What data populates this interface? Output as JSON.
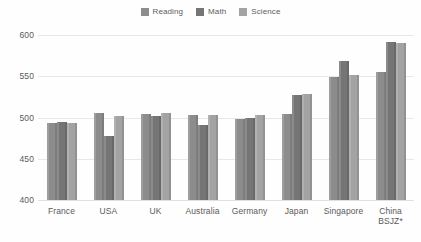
{
  "chart_data": {
    "type": "bar",
    "title": "",
    "subtitle": "",
    "xlabel": "",
    "ylabel": "",
    "ylim": [
      400,
      600
    ],
    "yticks": [
      400,
      450,
      500,
      550,
      600
    ],
    "ytick_labels": [
      "400",
      "450",
      "500",
      "550",
      "600"
    ],
    "grid": true,
    "legend_position": "top-center",
    "orientation": "vertical",
    "grouped": true,
    "categories": [
      "France",
      "USA",
      "UK",
      "Australia",
      "Germany",
      "Japan",
      "Singapore",
      "China\nBSJZ*"
    ],
    "series": [
      {
        "name": "Reading",
        "color": "#8c8c8c",
        "values": [
          493,
          505,
          504,
          503,
          498,
          504,
          549,
          555
        ]
      },
      {
        "name": "Math",
        "color": "#757575",
        "values": [
          495,
          478,
          502,
          491,
          500,
          527,
          569,
          591
        ]
      },
      {
        "name": "Science",
        "color": "#a3a3a3",
        "values": [
          493,
          502,
          505,
          503,
          503,
          529,
          551,
          590
        ]
      }
    ],
    "annotations": []
  },
  "legend": {
    "items": [
      {
        "label": "Reading",
        "color": "#8c8c8c"
      },
      {
        "label": "Math",
        "color": "#757575"
      },
      {
        "label": "Science",
        "color": "#a3a3a3"
      }
    ]
  },
  "axes": {
    "y": {
      "min": 400,
      "max": 600,
      "ticks": [
        "600",
        "550",
        "500",
        "450",
        "400"
      ]
    },
    "x": {
      "labels": [
        "France",
        "USA",
        "UK",
        "Australia",
        "Germany",
        "Japan",
        "Singapore",
        "China\nBSJZ*"
      ]
    }
  },
  "colors": {
    "background": "#fefefe",
    "gridline": "#e8e8e8",
    "axis_text": "#5a5a5a",
    "legend_text": "#5c5c5c"
  }
}
